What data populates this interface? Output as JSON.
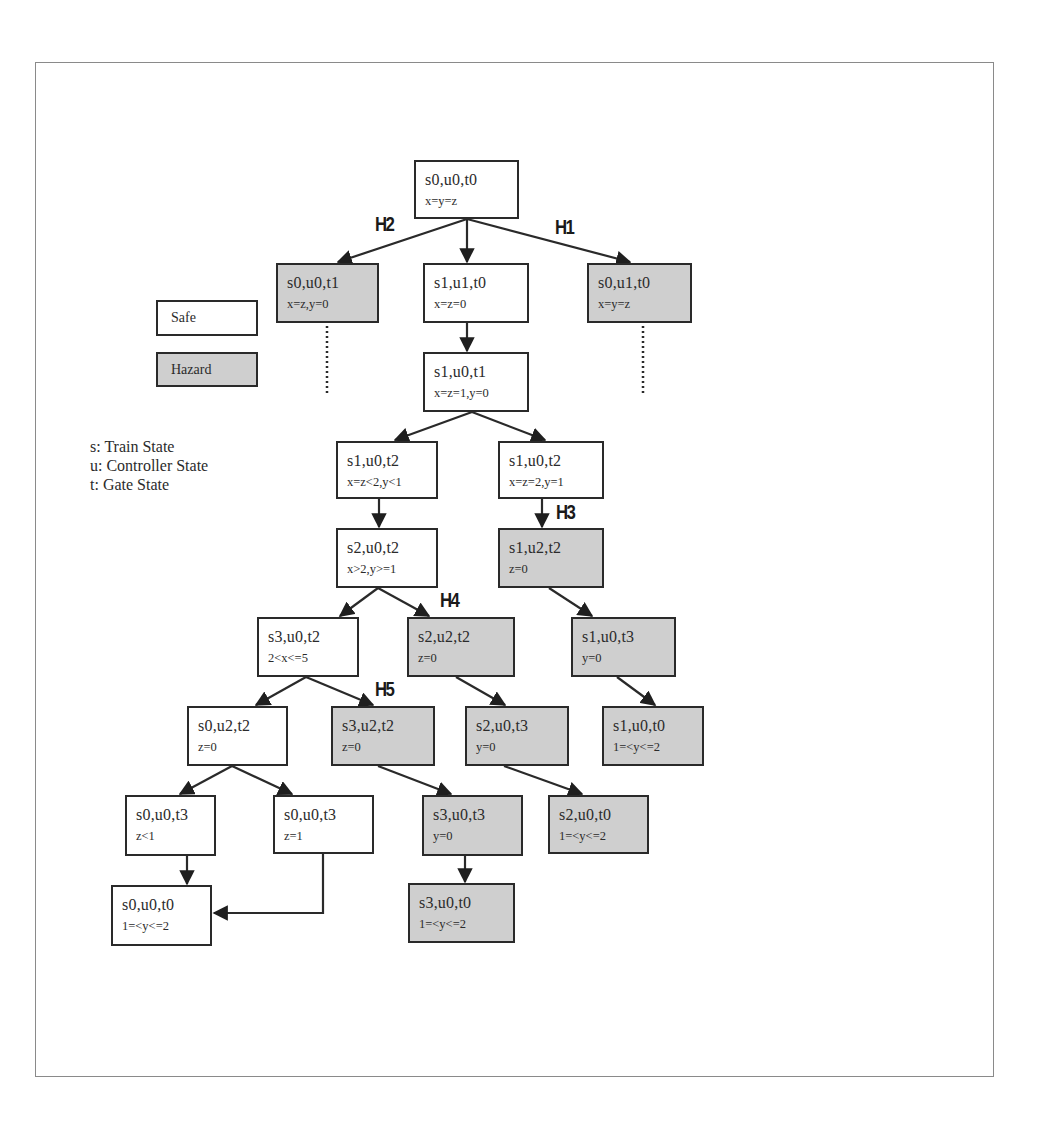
{
  "legend": {
    "safe_label": "Safe",
    "hazard_label": "Hazard",
    "key": [
      "s: Train State",
      "u: Controller State",
      "t: Gate State"
    ]
  },
  "colors": {
    "safe_fill": "#ffffff",
    "hazard_fill": "#cfcfcf",
    "border": "#2a2a2a"
  },
  "hazard_labels": [
    "H1",
    "H2",
    "H3",
    "H4",
    "H5"
  ],
  "nodes": [
    {
      "id": "n0",
      "state": "s0,u0,t0",
      "cond": "x=y=z",
      "type": "safe"
    },
    {
      "id": "n1",
      "state": "s0,u0,t1",
      "cond": "x=z,y=0",
      "type": "hazard"
    },
    {
      "id": "n2",
      "state": "s1,u1,t0",
      "cond": "x=z=0",
      "type": "safe"
    },
    {
      "id": "n3",
      "state": "s0,u1,t0",
      "cond": "x=y=z",
      "type": "hazard"
    },
    {
      "id": "n4",
      "state": "s1,u0,t1",
      "cond": "x=z=1,y=0",
      "type": "safe"
    },
    {
      "id": "n5",
      "state": "s1,u0,t2",
      "cond": "x=z<2,y<1",
      "type": "safe"
    },
    {
      "id": "n6",
      "state": "s1,u0,t2",
      "cond": "x=z=2,y=1",
      "type": "safe"
    },
    {
      "id": "n7",
      "state": "s2,u0,t2",
      "cond": "x>2,y>=1",
      "type": "safe"
    },
    {
      "id": "n8",
      "state": "s1,u2,t2",
      "cond": "z=0",
      "type": "hazard"
    },
    {
      "id": "n9",
      "state": "s3,u0,t2",
      "cond": "2<x<=5",
      "type": "safe"
    },
    {
      "id": "n10",
      "state": "s2,u2,t2",
      "cond": "z=0",
      "type": "hazard"
    },
    {
      "id": "n11",
      "state": "s1,u0,t3",
      "cond": "y=0",
      "type": "hazard"
    },
    {
      "id": "n12",
      "state": "s0,u2,t2",
      "cond": "z=0",
      "type": "safe"
    },
    {
      "id": "n13",
      "state": "s3,u2,t2",
      "cond": "z=0",
      "type": "hazard"
    },
    {
      "id": "n14",
      "state": "s2,u0,t3",
      "cond": "y=0",
      "type": "hazard"
    },
    {
      "id": "n15",
      "state": "s1,u0,t0",
      "cond": "1=<y<=2",
      "type": "hazard"
    },
    {
      "id": "n16",
      "state": "s0,u0,t3",
      "cond": "z<1",
      "type": "safe"
    },
    {
      "id": "n17",
      "state": "s0,u0,t3",
      "cond": "z=1",
      "type": "safe"
    },
    {
      "id": "n18",
      "state": "s3,u0,t3",
      "cond": "y=0",
      "type": "hazard"
    },
    {
      "id": "n19",
      "state": "s2,u0,t0",
      "cond": "1=<y<=2",
      "type": "hazard"
    },
    {
      "id": "n20",
      "state": "s0,u0,t0",
      "cond": "1=<y<=2",
      "type": "safe"
    },
    {
      "id": "n21",
      "state": "s3,u0,t0",
      "cond": "1=<y<=2",
      "type": "hazard"
    }
  ],
  "edges": [
    {
      "from": "n0",
      "to": "n1",
      "label": "H2"
    },
    {
      "from": "n0",
      "to": "n2"
    },
    {
      "from": "n0",
      "to": "n3",
      "label": "H1"
    },
    {
      "from": "n2",
      "to": "n4"
    },
    {
      "from": "n4",
      "to": "n5"
    },
    {
      "from": "n4",
      "to": "n6"
    },
    {
      "from": "n5",
      "to": "n7"
    },
    {
      "from": "n6",
      "to": "n8",
      "label": "H3"
    },
    {
      "from": "n7",
      "to": "n9"
    },
    {
      "from": "n7",
      "to": "n10",
      "label": "H4"
    },
    {
      "from": "n8",
      "to": "n11"
    },
    {
      "from": "n9",
      "to": "n12"
    },
    {
      "from": "n9",
      "to": "n13",
      "label": "H5"
    },
    {
      "from": "n10",
      "to": "n14"
    },
    {
      "from": "n11",
      "to": "n15"
    },
    {
      "from": "n12",
      "to": "n16"
    },
    {
      "from": "n12",
      "to": "n17"
    },
    {
      "from": "n13",
      "to": "n18"
    },
    {
      "from": "n14",
      "to": "n19"
    },
    {
      "from": "n16",
      "to": "n20"
    },
    {
      "from": "n17",
      "to": "n20"
    },
    {
      "from": "n18",
      "to": "n21"
    }
  ],
  "continuations": [
    {
      "from": "n1",
      "style": "dotted"
    },
    {
      "from": "n3",
      "style": "dotted"
    }
  ]
}
